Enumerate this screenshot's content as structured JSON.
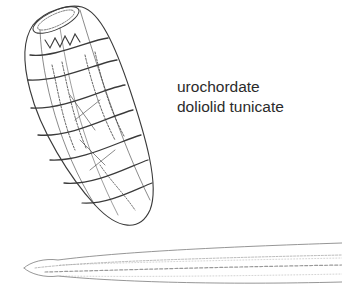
{
  "figure": {
    "labels": {
      "line1": "urochordate",
      "line2": "doliolid tunicate"
    },
    "illustrations": [
      {
        "name": "doliolid-tunicate-drawing",
        "description": "barrel-shaped doliolid tunicate with muscle bands"
      },
      {
        "name": "lancelet-larva-drawing",
        "description": "elongated tapered larva/lancelet body along bottom"
      }
    ],
    "colors": {
      "background": "#ffffff",
      "ink": "#3a3a3a",
      "text": "#2b2b2b"
    }
  }
}
